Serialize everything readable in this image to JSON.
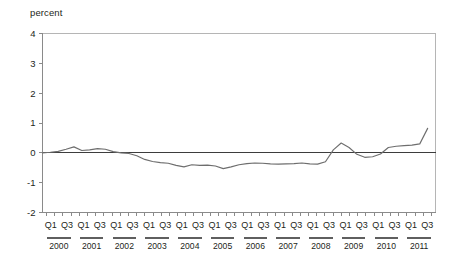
{
  "chart_data": {
    "type": "line",
    "title": "",
    "subtitle": "",
    "xlabel": "",
    "ylabel": "percent",
    "ylim": [
      -2,
      4
    ],
    "yticks": [
      4,
      3,
      2,
      1,
      0,
      -1,
      -2
    ],
    "ytick_labels": [
      "4",
      "3",
      "2",
      "1",
      "0",
      "-1",
      "-2"
    ],
    "grid": false,
    "legend": "none",
    "zero_reference_line": true,
    "quarter_tick_labels": [
      "Q1",
      "Q3"
    ],
    "x_tick_labels": [
      "Q1",
      "Q3",
      "Q1",
      "Q3",
      "Q1",
      "Q3",
      "Q1",
      "Q3",
      "Q1",
      "Q3",
      "Q1",
      "Q3",
      "Q1",
      "Q3",
      "Q1",
      "Q3",
      "Q1",
      "Q3",
      "Q1",
      "Q3",
      "Q1",
      "Q3",
      "Q1",
      "Q3"
    ],
    "year_groups": [
      "2000",
      "2001",
      "2002",
      "2003",
      "2004",
      "2005",
      "2006",
      "2007",
      "2008",
      "2009",
      "2010",
      "2011"
    ],
    "x": [
      "2000 Q1",
      "2000 Q2",
      "2000 Q3",
      "2000 Q4",
      "2001 Q1",
      "2001 Q2",
      "2001 Q3",
      "2001 Q4",
      "2002 Q1",
      "2002 Q2",
      "2002 Q3",
      "2002 Q4",
      "2003 Q1",
      "2003 Q2",
      "2003 Q3",
      "2003 Q4",
      "2004 Q1",
      "2004 Q2",
      "2004 Q3",
      "2004 Q4",
      "2005 Q1",
      "2005 Q2",
      "2005 Q3",
      "2005 Q4",
      "2006 Q1",
      "2006 Q2",
      "2006 Q3",
      "2006 Q4",
      "2007 Q1",
      "2007 Q2",
      "2007 Q3",
      "2007 Q4",
      "2008 Q1",
      "2008 Q2",
      "2008 Q3",
      "2008 Q4",
      "2009 Q1",
      "2009 Q2",
      "2009 Q3",
      "2009 Q4",
      "2010 Q1",
      "2010 Q2",
      "2010 Q3",
      "2010 Q4",
      "2011 Q1",
      "2011 Q2",
      "2011 Q3"
    ],
    "values": [
      0.0,
      0.02,
      0.05,
      0.12,
      0.2,
      0.08,
      0.1,
      0.14,
      0.12,
      0.04,
      0.0,
      -0.02,
      -0.1,
      -0.22,
      -0.29,
      -0.33,
      -0.35,
      -0.42,
      -0.47,
      -0.4,
      -0.42,
      -0.41,
      -0.44,
      -0.53,
      -0.47,
      -0.4,
      -0.36,
      -0.34,
      -0.35,
      -0.37,
      -0.38,
      -0.37,
      -0.36,
      -0.34,
      -0.37,
      -0.38,
      -0.3,
      0.1,
      0.33,
      0.18,
      -0.05,
      -0.15,
      -0.13,
      -0.04,
      0.18,
      0.22,
      0.24
    ],
    "series": [
      {
        "name": "percent",
        "values": [
          0.0,
          0.02,
          0.05,
          0.12,
          0.2,
          0.08,
          0.1,
          0.14,
          0.12,
          0.04,
          0.0,
          -0.02,
          -0.1,
          -0.22,
          -0.29,
          -0.33,
          -0.35,
          -0.42,
          -0.47,
          -0.4,
          -0.42,
          -0.41,
          -0.44,
          -0.53,
          -0.47,
          -0.4,
          -0.36,
          -0.34,
          -0.35,
          -0.37,
          -0.38,
          -0.37,
          -0.36,
          -0.34,
          -0.37,
          -0.38,
          -0.3,
          0.1,
          0.33,
          0.18,
          -0.05,
          -0.15,
          -0.13,
          -0.04,
          0.18,
          0.22,
          0.24
        ]
      }
    ],
    "extended_tail": {
      "note": "line continues past 2011 Q3 rising sharply",
      "values": [
        0.26,
        0.3,
        0.82
      ]
    },
    "colors": {
      "series_line": "#6e6e6e",
      "zero_line": "#3d3d3d",
      "axis": "#8a8a8a",
      "frame": "#b5b5b5",
      "text": "#231f20",
      "background": "#ffffff"
    }
  }
}
